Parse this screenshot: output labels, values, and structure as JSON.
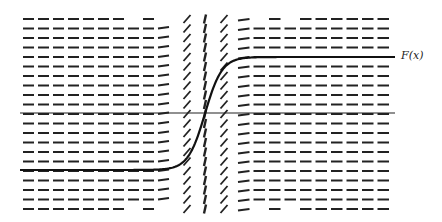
{
  "figure": {
    "type": "slope-field",
    "curve_label": "F(x)",
    "colors": {
      "ink": "#222222",
      "background": "#ffffff"
    },
    "grid": {
      "rows": 21,
      "row_top_y": 19,
      "row_spacing": 9.5,
      "left_region": {
        "x_start": 22,
        "x_end": 172,
        "dash_count": 10,
        "slope": "horizontal"
      },
      "steep_columns": [
        {
          "x": 187,
          "slope": "steep-positive"
        },
        {
          "x": 205,
          "slope": "near-vertical"
        },
        {
          "x": 224,
          "slope": "steep-positive"
        }
      ],
      "right_region": {
        "x_start": 237,
        "x_end": 392,
        "dash_count": 10,
        "slope": "horizontal"
      }
    },
    "axis": {
      "y": 113,
      "x_start": 20,
      "x_end": 395
    },
    "curve": {
      "lower_plateau_y": 170,
      "upper_plateau_y": 57,
      "x_start": 20,
      "x_end": 395,
      "transition_center_x": 205
    }
  }
}
